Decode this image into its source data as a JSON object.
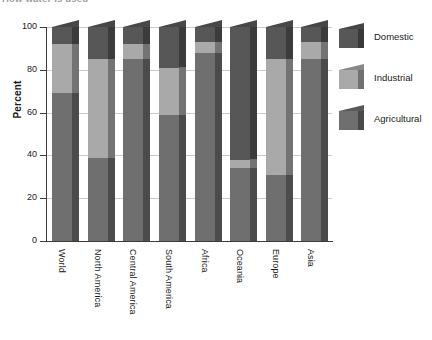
{
  "chart_data": {
    "type": "bar",
    "subtype": "stacked-percentage-3d",
    "title": "How water is used",
    "xlabel": "",
    "ylabel": "Percent",
    "ylim": [
      0,
      100
    ],
    "yticks": [
      0,
      20,
      40,
      60,
      80,
      100
    ],
    "grid": true,
    "legend_position": "right",
    "categories": [
      "World",
      "North America",
      "Central America",
      "South America",
      "Africa",
      "Oceania",
      "Europe",
      "Asia"
    ],
    "series": [
      {
        "name": "Agricultural",
        "color": "#6f6f6f",
        "values": [
          69,
          39,
          85,
          59,
          88,
          34,
          31,
          85
        ]
      },
      {
        "name": "Industrial",
        "color": "#a9a9a9",
        "values": [
          23,
          46,
          7,
          22,
          5,
          4,
          54,
          8
        ]
      },
      {
        "name": "Domestic",
        "color": "#575757",
        "values": [
          8,
          15,
          8,
          19,
          7,
          62,
          15,
          7
        ]
      }
    ],
    "segment_tops": {
      "World": {
        "agricultural": 69,
        "industrial": 92,
        "domestic": 100
      },
      "North America": {
        "agricultural": 39,
        "industrial": 85,
        "domestic": 100
      },
      "Central America": {
        "agricultural": 85,
        "industrial": 92,
        "domestic": 100
      },
      "South America": {
        "agricultural": 59,
        "industrial": 81,
        "domestic": 100
      },
      "Africa": {
        "agricultural": 88,
        "industrial": 93,
        "domestic": 100
      },
      "Oceania": {
        "agricultural": 34,
        "industrial": 38,
        "domestic": 100
      },
      "Europe": {
        "agricultural": 31,
        "industrial": 85,
        "domestic": 100
      },
      "Asia": {
        "agricultural": 85,
        "industrial": 93,
        "domestic": 100
      }
    }
  },
  "axis": {
    "y_label": "Percent",
    "ticks": [
      "100",
      "80",
      "60",
      "40",
      "20",
      "0"
    ]
  },
  "legend": {
    "items": [
      {
        "label": "Domestic",
        "color": "#575757"
      },
      {
        "label": "Industrial",
        "color": "#a9a9a9"
      },
      {
        "label": "Agricultural",
        "color": "#6f6f6f"
      }
    ]
  },
  "xlabels": [
    "World",
    "North America",
    "Central America",
    "South America",
    "Africa",
    "Oceania",
    "Europe",
    "Asia"
  ],
  "title": "How water is used",
  "colors": {
    "domestic": "#575757",
    "industrial": "#a9a9a9",
    "agricultural": "#6f6f6f",
    "axis": "#3c3c3c",
    "grid": "#c9c9c9",
    "background": "#ffffff"
  }
}
